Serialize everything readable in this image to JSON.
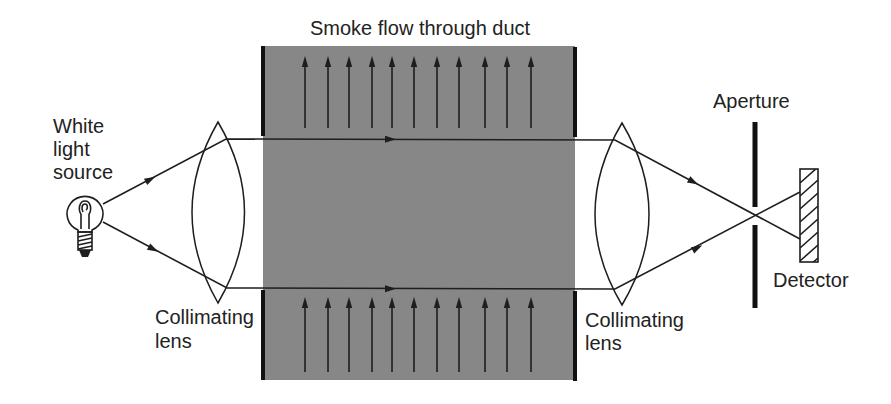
{
  "diagram": {
    "title": "Smoke flow through duct",
    "labels": {
      "source": [
        "White",
        "light",
        "source"
      ],
      "lens_left": [
        "Collimating",
        "lens"
      ],
      "lens_right": [
        "Collimating",
        "lens"
      ],
      "aperture": "Aperture",
      "detector": "Detector"
    },
    "flow_direction": "up",
    "beam_direction": "right",
    "colors": {
      "duct_fill": "#878787",
      "line": "#1e1e1e",
      "background": "#ffffff"
    }
  }
}
